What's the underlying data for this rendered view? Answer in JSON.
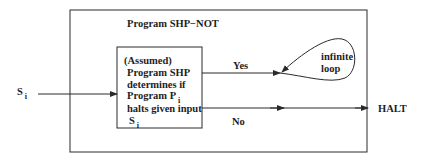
{
  "diagram": {
    "outer_box": {
      "title": "Program SHP−NOT"
    },
    "inner_box": {
      "line1": "(Assumed)",
      "line2": "Program SHP",
      "line3": "determines if",
      "line4_main": "Program P",
      "line4_sub": "i",
      "line5": "halts given input",
      "line6_main": "S",
      "line6_sub": "i"
    },
    "input": {
      "label_main": "S",
      "label_sub": "i"
    },
    "yes_branch": {
      "label": "Yes",
      "loop_label_1": "infinite",
      "loop_label_2": "loop"
    },
    "no_branch": {
      "label": "No",
      "output_label": "HALT"
    },
    "colors": {
      "stroke": "#2a2a2a",
      "background": "#ffffff"
    }
  }
}
